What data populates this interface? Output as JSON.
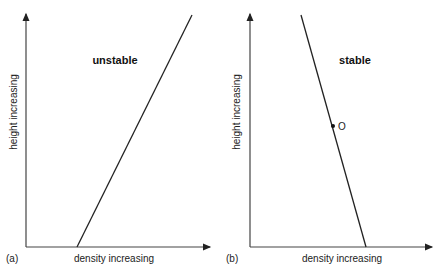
{
  "panels": [
    {
      "id": "a",
      "tag": "(a)",
      "title": "unstable",
      "xlabel": "density increasing",
      "ylabel": "height increasing",
      "line_direction": "density increases with height",
      "point": null
    },
    {
      "id": "b",
      "tag": "(b)",
      "title": "stable",
      "xlabel": "density increasing",
      "ylabel": "height increasing",
      "line_direction": "density decreases with height",
      "point": {
        "label": "O"
      }
    }
  ]
}
